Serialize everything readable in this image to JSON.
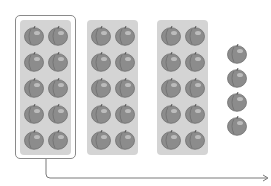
{
  "diagram": {
    "groups": [
      {
        "label": "tray-1",
        "count": 10,
        "highlighted": true
      },
      {
        "label": "tray-2",
        "count": 10,
        "highlighted": false
      },
      {
        "label": "tray-3",
        "count": 10,
        "highlighted": false
      }
    ],
    "loose": {
      "count": 4
    },
    "total": 34,
    "colors": {
      "tray": "#d4d4d4",
      "outline": "#8a8a8a",
      "apple_fill": "#8c8c8c",
      "apple_shadow": "#6e6e6e",
      "apple_highlight": "#c8c8c8",
      "connector": "#7a7a7a"
    }
  }
}
